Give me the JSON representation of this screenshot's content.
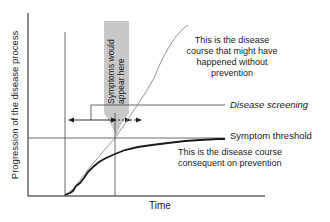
{
  "axes": {
    "y_label": "Progression of the disease process",
    "x_label": "Time"
  },
  "annotations": {
    "without_prevention": [
      "This is the disease",
      "course that might have",
      "happened without",
      "prevention"
    ],
    "disease_screening": "Disease screening",
    "symptom_threshold": "Symptom threshold",
    "with_prevention": [
      "This is the disease course",
      "consequent on prevention"
    ],
    "symptoms_box": [
      "Symptoms would",
      "appear here"
    ]
  },
  "colors": {
    "line_dark": "#1a1a1a",
    "line_gray": "#8a8a8a",
    "band_gray": "#c8c8c8",
    "background": "#ffffff"
  }
}
